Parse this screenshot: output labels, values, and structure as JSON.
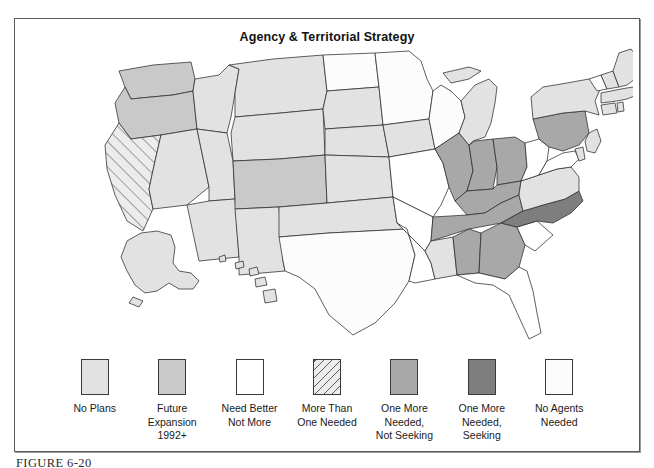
{
  "figure": {
    "title": "Agency & Territorial Strategy",
    "caption": "FIGURE 6-20"
  },
  "legend": {
    "items": [
      {
        "key": "no-plans",
        "label": "No Plans",
        "color": "#e2e2e2",
        "pattern": "solid"
      },
      {
        "key": "future-expansion",
        "label": "Future\nExpansion\n1992+",
        "color": "#c9c9c9",
        "pattern": "solid"
      },
      {
        "key": "need-better-not-more",
        "label": "Need Better\nNot More",
        "color": "#ffffff",
        "pattern": "solid"
      },
      {
        "key": "more-than-one-needed",
        "label": "More Than\nOne Needed",
        "color": "#e2e2e2",
        "pattern": "hatch"
      },
      {
        "key": "one-more-not-seeking",
        "label": "One More\nNeeded,\nNot Seeking",
        "color": "#a8a8a8",
        "pattern": "solid"
      },
      {
        "key": "one-more-seeking",
        "label": "One More\nNeeded,\nSeeking",
        "color": "#7e7e7e",
        "pattern": "solid"
      },
      {
        "key": "no-agents-needed",
        "label": "No Agents\nNeeded",
        "color": "#fcfcfc",
        "pattern": "solid"
      }
    ]
  },
  "chart_data": {
    "type": "map",
    "title": "Agency & Territorial Strategy",
    "region": "United States",
    "categories": [
      "No Plans",
      "Future Expansion 1992+",
      "Need Better Not More",
      "More Than One Needed",
      "One More Needed, Not Seeking",
      "One More Needed, Seeking",
      "No Agents Needed"
    ],
    "category_colors": [
      "#e2e2e2",
      "#c9c9c9",
      "#ffffff",
      "#e2e2e2",
      "#a8a8a8",
      "#7e7e7e",
      "#fcfcfc"
    ],
    "states": {
      "WA": "future-expansion",
      "OR": "future-expansion",
      "CA": "more-than-one-needed",
      "NV": "no-plans",
      "ID": "no-plans",
      "MT": "no-plans",
      "WY": "no-plans",
      "UT": "no-plans",
      "AZ": "no-plans",
      "CO": "future-expansion",
      "NM": "no-plans",
      "ND": "no-agents-needed",
      "SD": "no-plans",
      "NE": "no-plans",
      "KS": "no-plans",
      "OK": "no-plans",
      "TX": "no-agents-needed",
      "MN": "no-agents-needed",
      "IA": "no-plans",
      "MO": "need-better-not-more",
      "AR": "need-better-not-more",
      "LA": "need-better-not-more",
      "WI": "no-agents-needed",
      "IL": "one-more-not-seeking",
      "MI": "no-plans",
      "IN": "one-more-not-seeking",
      "OH": "one-more-not-seeking",
      "KY": "one-more-not-seeking",
      "TN": "one-more-not-seeking",
      "MS": "no-plans",
      "AL": "one-more-not-seeking",
      "GA": "one-more-not-seeking",
      "FL": "need-better-not-more",
      "SC": "need-better-not-more",
      "NC": "one-more-seeking",
      "VA": "no-plans",
      "WV": "need-better-not-more",
      "MD": "need-better-not-more",
      "DE": "no-plans",
      "PA": "one-more-not-seeking",
      "NJ": "no-plans",
      "NY": "no-plans",
      "CT": "no-plans",
      "RI": "no-plans",
      "MA": "no-plans",
      "VT": "no-agents-needed",
      "NH": "no-plans",
      "ME": "no-plans",
      "AK": "no-plans",
      "HI": "no-plans"
    }
  }
}
